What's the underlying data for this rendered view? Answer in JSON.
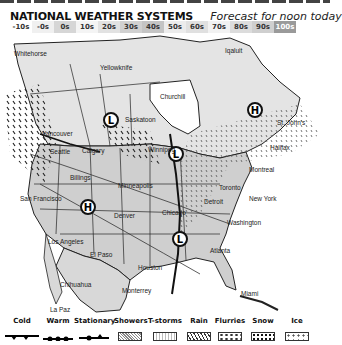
{
  "header": {
    "title": "NATIONAL WEATHER SYSTEMS",
    "subtitle": "Forecast for noon today"
  },
  "temperature_scale": [
    {
      "label": "-10s",
      "color": "#ffffff"
    },
    {
      "label": "-0s",
      "color": "#f0f0f0"
    },
    {
      "label": "0s",
      "color": "#d6d6d6"
    },
    {
      "label": "10s",
      "color": "#f4f4f4"
    },
    {
      "label": "20s",
      "color": "#e2e2e2"
    },
    {
      "label": "30s",
      "color": "#d0d0d0"
    },
    {
      "label": "40s",
      "color": "#c4c4c4"
    },
    {
      "label": "50s",
      "color": "#ececec"
    },
    {
      "label": "60s",
      "color": "#e0e0e0"
    },
    {
      "label": "70s",
      "color": "#f2f2f2"
    },
    {
      "label": "80s",
      "color": "#dcdcdc"
    },
    {
      "label": "90s",
      "color": "#cfcfcf"
    },
    {
      "label": "100s",
      "color": "#9a9a9a"
    }
  ],
  "map": {
    "cities": [
      {
        "name": "Whitehorse",
        "x": 14,
        "y": 16
      },
      {
        "name": "Yellowknife",
        "x": 100,
        "y": 30
      },
      {
        "name": "Iqaluit",
        "x": 225,
        "y": 13
      },
      {
        "name": "Churchill",
        "x": 160,
        "y": 59
      },
      {
        "name": "Saskatoon",
        "x": 125,
        "y": 82
      },
      {
        "name": "Vancouver",
        "x": 42,
        "y": 96
      },
      {
        "name": "Calgary",
        "x": 82,
        "y": 113
      },
      {
        "name": "Seattle",
        "x": 50,
        "y": 114
      },
      {
        "name": "Winnipeg",
        "x": 148,
        "y": 112
      },
      {
        "name": "St. John's",
        "x": 277,
        "y": 85
      },
      {
        "name": "Halifax",
        "x": 270,
        "y": 110
      },
      {
        "name": "Montreal",
        "x": 249,
        "y": 132
      },
      {
        "name": "Billings",
        "x": 70,
        "y": 140
      },
      {
        "name": "Minneapolis",
        "x": 118,
        "y": 148
      },
      {
        "name": "Toronto",
        "x": 219,
        "y": 150
      },
      {
        "name": "New York",
        "x": 249,
        "y": 161
      },
      {
        "name": "San Francisco",
        "x": 20,
        "y": 161
      },
      {
        "name": "Detroit",
        "x": 204,
        "y": 164
      },
      {
        "name": "Denver",
        "x": 114,
        "y": 178
      },
      {
        "name": "Chicago",
        "x": 162,
        "y": 175
      },
      {
        "name": "Washington",
        "x": 227,
        "y": 185
      },
      {
        "name": "Los Angeles",
        "x": 48,
        "y": 204
      },
      {
        "name": "El Paso",
        "x": 90,
        "y": 217
      },
      {
        "name": "Atlanta",
        "x": 210,
        "y": 213
      },
      {
        "name": "Houston",
        "x": 138,
        "y": 230
      },
      {
        "name": "Chihuahua",
        "x": 60,
        "y": 247
      },
      {
        "name": "Monterrey",
        "x": 122,
        "y": 253
      },
      {
        "name": "Miami",
        "x": 241,
        "y": 256
      },
      {
        "name": "La Paz",
        "x": 50,
        "y": 272
      }
    ],
    "pressure_centers": [
      {
        "type": "L",
        "x": 111,
        "y": 86
      },
      {
        "type": "H",
        "x": 255,
        "y": 76
      },
      {
        "type": "L",
        "x": 176,
        "y": 120
      },
      {
        "type": "H",
        "x": 88,
        "y": 173
      },
      {
        "type": "L",
        "x": 180,
        "y": 205
      }
    ]
  },
  "legend": {
    "fronts": [
      {
        "label": "Cold"
      },
      {
        "label": "Warm"
      },
      {
        "label": "Stationary"
      }
    ],
    "precipitation": [
      {
        "label": "Showers"
      },
      {
        "label": "T-storms"
      },
      {
        "label": "Rain"
      },
      {
        "label": "Flurries"
      },
      {
        "label": "Snow"
      },
      {
        "label": "Ice"
      }
    ]
  }
}
